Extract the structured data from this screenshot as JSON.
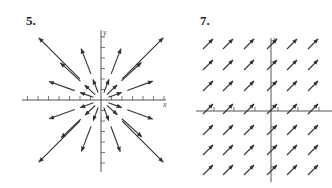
{
  "figures": [
    {
      "label": "5.",
      "x_axis_label": "x",
      "y_axis_label": "y",
      "description": "Radial vector field pointing outward from origin, arrow length proportional to distance"
    },
    {
      "label": "7.",
      "x_axis_label": "x",
      "y_axis_label": "y",
      "description": "Constant vector field, all arrows pointing up-right at 45 degrees"
    }
  ],
  "colors": {
    "ink": "#333333",
    "axis": "#555555",
    "background": "#ffffff"
  }
}
